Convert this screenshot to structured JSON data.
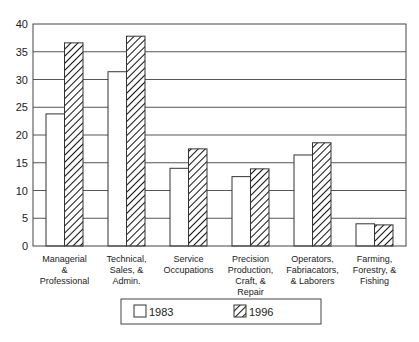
{
  "chart_data": {
    "type": "bar",
    "title": "",
    "xlabel": "",
    "ylabel": "",
    "ylim": [
      0,
      40
    ],
    "yticks": [
      0,
      5,
      10,
      15,
      20,
      25,
      30,
      35,
      40
    ],
    "grid": true,
    "legend_position": "bottom",
    "categories": [
      "Managerial & Professional",
      "Technical, Sales, & Admin.",
      "Service Occupations",
      "Precision Production, Craft, & Repair",
      "Operators, Fabriacators, & Laborers",
      "Farming, Forestry, & Fishing"
    ],
    "category_lines": [
      [
        "Managerial",
        "&",
        "Professional"
      ],
      [
        "Technical,",
        "Sales, &",
        "Admin."
      ],
      [
        "Service",
        "Occupations"
      ],
      [
        "Precision",
        "Production,",
        "Craft, &",
        "Repair"
      ],
      [
        "Operators,",
        "Fabriacators,",
        "& Laborers"
      ],
      [
        "Farming,",
        "Forestry, &",
        "Fishing"
      ]
    ],
    "series": [
      {
        "name": "1983",
        "pattern": "solid-white",
        "values": [
          23.8,
          31.4,
          14.0,
          12.5,
          16.4,
          4.0
        ]
      },
      {
        "name": "1996",
        "pattern": "diagonal-hatch",
        "values": [
          36.6,
          37.8,
          17.5,
          13.9,
          18.6,
          3.8
        ]
      }
    ]
  },
  "colors": {
    "line": "#444444",
    "grid": "#555555",
    "bar_fill": "#ffffff",
    "hatch": "#111111"
  }
}
